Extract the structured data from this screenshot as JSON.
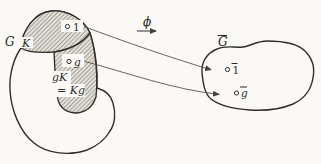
{
  "figure": {
    "title_semantic": "quotient-group-coset-mapping-diagram",
    "colors": {
      "background": "#faf9f5",
      "ink": "#2e2d2a",
      "thin_line": "#55534e",
      "hatch_line": "#a5a099",
      "hatch_bg": "#e3e1d9"
    },
    "map": {
      "phi_label": "ϕ"
    },
    "left_set": {
      "set_label": "G",
      "subgroup_label": "K",
      "identity_point_label": "1",
      "g_point_label": "g",
      "coset_label_line1": "gK",
      "coset_label_line2": "= Kg"
    },
    "right_set": {
      "set_label": "G",
      "identity_point_label": "1",
      "g_point_label": "g"
    }
  }
}
